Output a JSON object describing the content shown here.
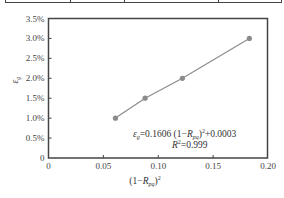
{
  "table_fragment": {
    "divider_positions": [
      5,
      70,
      124,
      218,
      281
    ]
  },
  "chart_data": {
    "type": "scatter",
    "title": "",
    "xlabel": "(1−R_pq)²",
    "ylabel": "ε_g",
    "xlim": [
      0,
      0.2
    ],
    "ylim": [
      0,
      0.035
    ],
    "x_ticks": [
      0,
      0.05,
      0.1,
      0.15,
      0.2
    ],
    "x_tick_labels": [
      "0",
      "0.05",
      "0.10",
      "0.15",
      "0.20"
    ],
    "y_ticks": [
      0,
      0.005,
      0.01,
      0.015,
      0.02,
      0.025,
      0.03,
      0.035
    ],
    "y_tick_labels": [
      "0",
      "0.5%",
      "1.0%",
      "1.5%",
      "2.0%",
      "2.5%",
      "3.0%",
      "3.5%"
    ],
    "grid": false,
    "legend": null,
    "series": [
      {
        "name": "measured",
        "marker": "circle",
        "line": true,
        "color": "#8c8c8c",
        "x": [
          0.061,
          0.088,
          0.122,
          0.183
        ],
        "y": [
          0.01,
          0.015,
          0.02,
          0.03
        ]
      }
    ],
    "annotations": [
      {
        "text": "ε_g=0.1606 (1−R_pq)²+0.0003",
        "x": 0.122,
        "y": 0.0063
      },
      {
        "text": "R²=0.999",
        "x": 0.138,
        "y": 0.0035
      }
    ]
  },
  "labels": {
    "ylabel_main": "ε",
    "ylabel_sub": "g",
    "xlabel_open": "(1−",
    "xlabel_R": "R",
    "xlabel_sub": "pq",
    "xlabel_close": ")",
    "xlabel_sup": "2",
    "eq_eps": "ε",
    "eq_eps_sub": "g",
    "eq_mid": "=0.1606  (1−",
    "eq_R": "R",
    "eq_R_sub": "pq",
    "eq_close": ")",
    "eq_sup": "2",
    "eq_tail": "+0.0003",
    "r2_R": "R",
    "r2_sup": "2",
    "r2_val": "=0.999"
  }
}
